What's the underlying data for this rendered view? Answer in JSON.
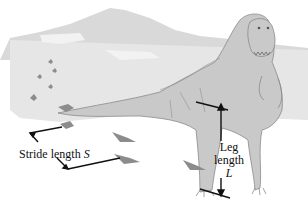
{
  "figure": {
    "annotations": {
      "stride": {
        "text": "Stride length",
        "variable": "S"
      },
      "leg": {
        "line1": "Leg",
        "line2": "length",
        "variable": "L"
      }
    },
    "colors": {
      "background": "#ffffff",
      "mountain": "#d6d6d6",
      "ground": "#e2e2e2",
      "dinosaur_fill": "#c8c8c8",
      "dinosaur_outline": "#8a8a8a",
      "footprint": "#8c8c8c",
      "arrow": "#111111"
    }
  }
}
